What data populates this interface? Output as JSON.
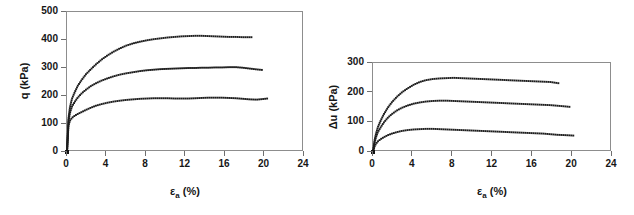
{
  "figure": {
    "background": "#ffffff",
    "ink_color": "#1c1c1c",
    "axis_color": "#8d8d8d"
  },
  "chart_data": [
    {
      "type": "line",
      "panel": "left",
      "title": "",
      "xlabel": "εa (%)",
      "xlabel_base": "ε",
      "xlabel_sub": "a",
      "xlabel_unit": "(%)",
      "ylabel": "q (kPa)",
      "xlim": [
        0,
        24
      ],
      "ylim": [
        0,
        500
      ],
      "xticks": [
        0,
        4,
        8,
        12,
        16,
        20,
        24
      ],
      "yticks": [
        0,
        100,
        200,
        300,
        400,
        500
      ],
      "grid": false,
      "legend": "none",
      "marker": "square",
      "series": [
        {
          "name": "q-high",
          "label": "",
          "color": "#1c1c1c",
          "x": [
            0,
            0.15,
            0.3,
            0.5,
            0.8,
            1.1,
            1.5,
            1.9,
            2.4,
            2.9,
            3.5,
            4.1,
            4.7,
            5.3,
            6.0,
            6.7,
            7.4,
            8.1,
            8.8,
            9.5,
            10.2,
            10.9,
            11.6,
            12.3,
            13.0,
            13.6,
            14.3,
            15.0,
            15.7,
            16.4,
            17.1,
            17.8,
            18.4,
            18.8
          ],
          "y": [
            0,
            120,
            160,
            190,
            215,
            237,
            258,
            277,
            295,
            312,
            330,
            345,
            358,
            369,
            380,
            388,
            394,
            399,
            403,
            406,
            409,
            411,
            413,
            414,
            415,
            415,
            414,
            413,
            412,
            411,
            411,
            410,
            410,
            410
          ]
        },
        {
          "name": "q-mid",
          "label": "",
          "color": "#1c1c1c",
          "x": [
            0,
            0.15,
            0.3,
            0.5,
            0.8,
            1.1,
            1.5,
            1.9,
            2.4,
            2.9,
            3.5,
            4.1,
            4.7,
            5.3,
            6.0,
            6.7,
            7.4,
            8.1,
            8.8,
            9.5,
            10.2,
            10.9,
            11.6,
            12.3,
            13.0,
            13.6,
            14.3,
            15.0,
            15.7,
            16.4,
            17.1,
            17.8,
            18.5,
            19.2,
            19.8
          ],
          "y": [
            0,
            110,
            140,
            162,
            180,
            195,
            210,
            222,
            235,
            245,
            255,
            263,
            270,
            276,
            281,
            285,
            289,
            292,
            294,
            296,
            297,
            298,
            299,
            300,
            300,
            301,
            301,
            302,
            302,
            303,
            303,
            301,
            298,
            295,
            293
          ]
        },
        {
          "name": "q-low",
          "label": "",
          "color": "#1c1c1c",
          "x": [
            0,
            0.15,
            0.3,
            0.5,
            0.8,
            1.1,
            1.5,
            1.9,
            2.4,
            2.9,
            3.5,
            4.1,
            4.7,
            5.3,
            6.0,
            6.7,
            7.4,
            8.1,
            8.8,
            9.5,
            10.2,
            10.9,
            11.6,
            12.3,
            13.0,
            13.6,
            14.3,
            15.0,
            15.7,
            16.4,
            17.1,
            17.8,
            18.5,
            19.2,
            19.8,
            20.3
          ],
          "y": [
            0,
            95,
            112,
            122,
            130,
            136,
            143,
            150,
            158,
            165,
            171,
            176,
            180,
            183,
            186,
            188,
            190,
            191,
            192,
            192,
            192,
            191,
            191,
            191,
            192,
            193,
            194,
            194,
            194,
            193,
            192,
            190,
            188,
            187,
            189,
            191
          ]
        }
      ]
    },
    {
      "type": "line",
      "panel": "right",
      "title": "",
      "xlabel": "εa (%)",
      "xlabel_base": "ε",
      "xlabel_sub": "a",
      "xlabel_unit": "(%)",
      "ylabel": "Δu (kPa)",
      "xlim": [
        0,
        24
      ],
      "ylim": [
        0,
        300
      ],
      "xticks": [
        0,
        4,
        8,
        12,
        16,
        20,
        24
      ],
      "yticks": [
        0,
        100,
        200,
        300
      ],
      "grid": false,
      "legend": "none",
      "marker": "square",
      "series": [
        {
          "name": "du-high",
          "label": "",
          "color": "#1c1c1c",
          "x": [
            0,
            0.15,
            0.3,
            0.5,
            0.8,
            1.1,
            1.5,
            1.9,
            2.4,
            2.9,
            3.5,
            4.1,
            4.7,
            5.3,
            6.0,
            6.7,
            7.4,
            8.1,
            8.8,
            9.5,
            10.2,
            10.9,
            11.6,
            12.3,
            13.0,
            13.6,
            14.3,
            15.0,
            15.7,
            16.4,
            17.1,
            17.8,
            18.4,
            18.8
          ],
          "y": [
            0,
            38,
            62,
            85,
            108,
            128,
            150,
            168,
            186,
            201,
            215,
            227,
            236,
            242,
            246,
            248,
            249,
            250,
            249,
            248,
            247,
            246,
            245,
            244,
            243,
            242,
            241,
            240,
            239,
            238,
            237,
            236,
            233,
            231
          ]
        },
        {
          "name": "du-mid",
          "label": "",
          "color": "#1c1c1c",
          "x": [
            0,
            0.15,
            0.3,
            0.5,
            0.8,
            1.1,
            1.5,
            1.9,
            2.4,
            2.9,
            3.5,
            4.1,
            4.7,
            5.3,
            6.0,
            6.7,
            7.4,
            8.1,
            8.8,
            9.5,
            10.2,
            10.9,
            11.6,
            12.3,
            13.0,
            13.6,
            14.3,
            15.0,
            15.7,
            16.4,
            17.1,
            17.8,
            18.5,
            19.2,
            19.8
          ],
          "y": [
            0,
            30,
            50,
            68,
            85,
            100,
            116,
            128,
            140,
            149,
            157,
            163,
            167,
            170,
            172,
            173,
            173,
            172,
            171,
            170,
            169,
            168,
            167,
            166,
            165,
            164,
            163,
            162,
            161,
            160,
            159,
            158,
            156,
            154,
            152
          ]
        },
        {
          "name": "du-low",
          "label": "",
          "color": "#1c1c1c",
          "x": [
            0,
            0.15,
            0.3,
            0.5,
            0.8,
            1.1,
            1.5,
            1.9,
            2.4,
            2.9,
            3.5,
            4.1,
            4.7,
            5.3,
            6.0,
            6.7,
            7.4,
            8.1,
            8.8,
            9.5,
            10.2,
            10.9,
            11.6,
            12.3,
            13.0,
            13.6,
            14.3,
            15.0,
            15.7,
            16.4,
            17.1,
            17.8,
            18.5,
            19.2,
            19.8,
            20.3
          ],
          "y": [
            0,
            18,
            28,
            36,
            44,
            50,
            57,
            62,
            67,
            71,
            74,
            76,
            77,
            78,
            78,
            77,
            76,
            75,
            74,
            73,
            72,
            71,
            70,
            69,
            68,
            67,
            66,
            65,
            64,
            63,
            62,
            60,
            58,
            57,
            56,
            55
          ]
        }
      ]
    }
  ]
}
